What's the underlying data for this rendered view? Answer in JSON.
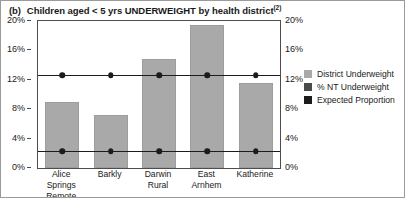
{
  "figure": {
    "panel_label": "(b)",
    "title": "Children aged < 5 yrs UNDERWEIGHT by health district",
    "title_superscript": "(2)"
  },
  "legend": {
    "position": "right",
    "items": [
      {
        "label": "District Underweight",
        "color": "#a9a9a9",
        "swatch": "legend-swatch-district"
      },
      {
        "label": "% NT Underweight",
        "color": "#4a4a4a",
        "swatch": "legend-swatch-nt"
      },
      {
        "label": "Expected Proportion",
        "color": "#1c1c1c",
        "swatch": "legend-swatch-expected"
      }
    ]
  },
  "axes": {
    "left_ticks": [
      "20%",
      "16%",
      "12%",
      "8%",
      "4%",
      "0%"
    ],
    "right_ticks": [
      "20%",
      "16%",
      "12%",
      "8%",
      "4%",
      "0%"
    ],
    "ylabel": "",
    "xlabel": ""
  },
  "chart_data": {
    "type": "bar",
    "xlabel": "",
    "ylabel": "",
    "ylim": [
      0,
      20
    ],
    "ytick_values": [
      0,
      4,
      8,
      12,
      16,
      20
    ],
    "ytick_labels": [
      "0%",
      "4%",
      "8%",
      "12%",
      "16%",
      "20%"
    ],
    "grid": false,
    "dual_y_axis": true,
    "categories": [
      "Alice Springs Remote",
      "Barkly",
      "Darwin Rural",
      "East Arnhem",
      "Katherine"
    ],
    "category_lines": [
      [
        "Alice Springs",
        "Remote"
      ],
      [
        "Barkly",
        ""
      ],
      [
        "Darwin",
        "Rural"
      ],
      [
        "East",
        "Arnhem"
      ],
      [
        "Katherine",
        ""
      ]
    ],
    "series": [
      {
        "name": "District Underweight",
        "type": "bar",
        "color": "#a9a9a9",
        "values": [
          9.0,
          7.2,
          14.8,
          19.4,
          11.6
        ]
      },
      {
        "name": "% NT Underweight",
        "type": "line",
        "color": "#1c1c1c",
        "values": [
          12.6,
          12.6,
          12.6,
          12.6,
          12.6
        ]
      },
      {
        "name": "Expected Proportion",
        "type": "line",
        "color": "#1c1c1c",
        "values": [
          2.3,
          2.3,
          2.3,
          2.3,
          2.3
        ]
      }
    ]
  }
}
